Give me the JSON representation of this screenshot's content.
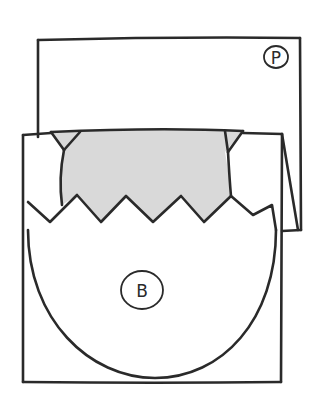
{
  "diagram": {
    "colors": {
      "ink": "#2a2a2a",
      "shade": "#d9d9d9",
      "background": "#ffffff"
    },
    "labels": {
      "back_panel": "P",
      "front_panel": "B"
    }
  }
}
